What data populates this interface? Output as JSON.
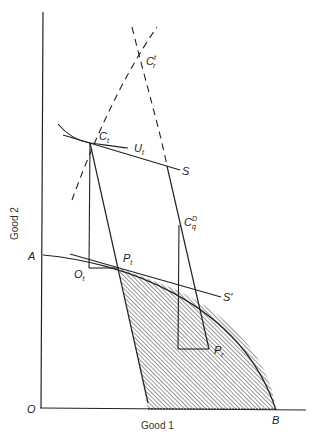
{
  "diagram": {
    "axes": {
      "x_label": "Good 1",
      "y_label": "Good 2",
      "origin": "O"
    },
    "points": {
      "A": "A",
      "B": "B",
      "O_t": {
        "base": "O",
        "sub": "t"
      },
      "P_t": {
        "base": "P",
        "sub": "t"
      },
      "P_r": {
        "base": "P",
        "sub": "r"
      },
      "C_t": {
        "base": "C",
        "sub": "t"
      },
      "C_r_t": {
        "base": "C",
        "sup": "t",
        "sub": "r"
      },
      "C_q_D": {
        "base": "C",
        "sup": "D",
        "sub": "q"
      }
    },
    "curves": {
      "U_t": {
        "base": "U",
        "sub": "t"
      },
      "S": "S",
      "S_prime": "S'"
    },
    "colors": {
      "line": "#222222",
      "hatch": "#333333",
      "background": "#ffffff"
    }
  }
}
